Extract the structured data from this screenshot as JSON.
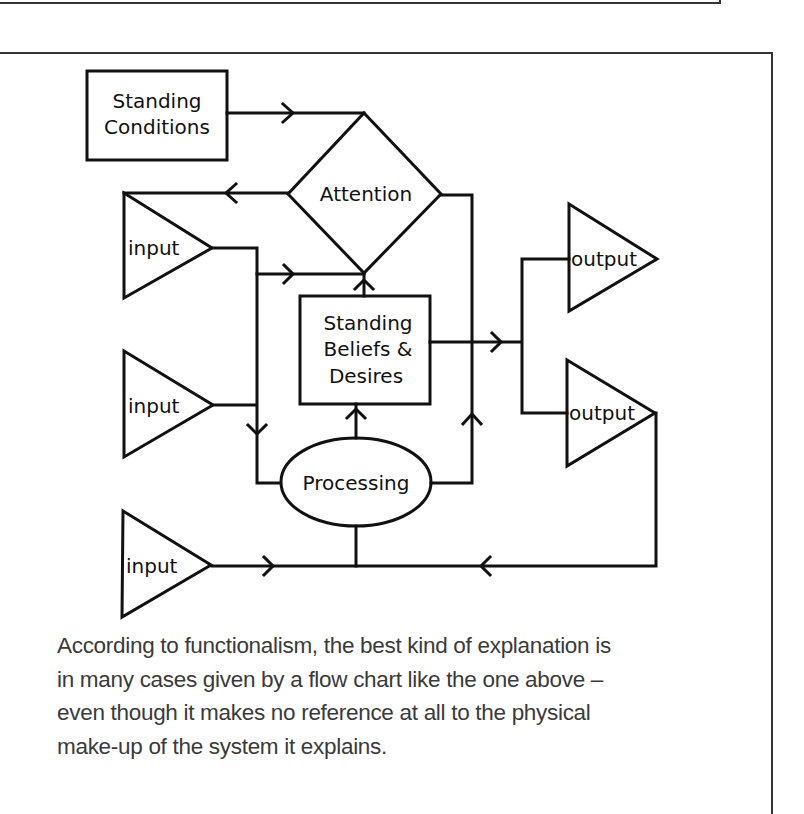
{
  "diagram": {
    "nodes": {
      "standing_conditions": {
        "line1": "Standing",
        "line2": "Conditions"
      },
      "attention": {
        "label": "Attention"
      },
      "standing_beliefs": {
        "line1": "Standing",
        "line2": "Beliefs &",
        "line3": "Desires"
      },
      "processing": {
        "label": "Processing"
      },
      "inputs": [
        {
          "label": "input"
        },
        {
          "label": "input"
        },
        {
          "label": "input"
        }
      ],
      "outputs": [
        {
          "label": "output"
        },
        {
          "label": "output"
        }
      ]
    },
    "stroke_color": "#111111"
  },
  "caption": {
    "lines": [
      "According to functionalism, the best kind of explanation is",
      "in many cases given by a flow chart like the one above –",
      "even though it makes no reference at all to the physical",
      "make-up of the system it explains."
    ]
  }
}
